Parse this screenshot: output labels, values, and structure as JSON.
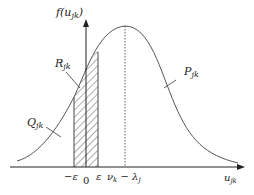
{
  "diagram": {
    "type": "bell-curve-distribution",
    "y_axis_label": {
      "main": "f(u",
      "sub": "jk",
      "close": ")"
    },
    "x_axis_label": {
      "main": "u",
      "sub": "jk"
    },
    "region_labels": {
      "R": {
        "main": "R",
        "sub": "jk"
      },
      "P": {
        "main": "P",
        "sub": "jk"
      },
      "Q": {
        "main": "Q",
        "sub": "jk"
      }
    },
    "x_ticks": {
      "neg_eps": "−ε",
      "zero": "0",
      "eps": "ε",
      "peak": {
        "main": "ν",
        "sub1": "k",
        "mid": " − λ",
        "sub2": "j"
      }
    },
    "colors": {
      "curve": "#555555",
      "axis": "#222222",
      "hatch": "#333333"
    }
  }
}
